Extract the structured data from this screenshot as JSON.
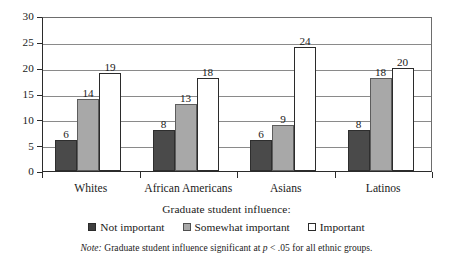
{
  "chart_data": {
    "type": "bar",
    "title": "",
    "xlabel": "",
    "ylabel": "",
    "ylim": [
      0,
      30
    ],
    "yticks": [
      0,
      5,
      10,
      15,
      20,
      25,
      30
    ],
    "grid": true,
    "legend_position": "bottom",
    "categories": [
      "Whites",
      "African Americans",
      "Asians",
      "Latinos"
    ],
    "series": [
      {
        "name": "Not important",
        "color": "#4a4a4a",
        "values": [
          6,
          8,
          6,
          8
        ]
      },
      {
        "name": "Somewhat important",
        "color": "#a8a8a8",
        "values": [
          14,
          13,
          9,
          18
        ]
      },
      {
        "name": "Important",
        "color": "#ffffff",
        "values": [
          19,
          18,
          24,
          20
        ]
      }
    ]
  },
  "legend": {
    "title": "Graduate student influence:",
    "items": [
      {
        "label": "Not important"
      },
      {
        "label": "Somewhat important"
      },
      {
        "label": "Important"
      }
    ]
  },
  "note": {
    "prefix": "Note:",
    "text_before": " Graduate student influence significant at ",
    "p_symbol": "p",
    "text_after": " < .05 for all ethnic groups."
  }
}
